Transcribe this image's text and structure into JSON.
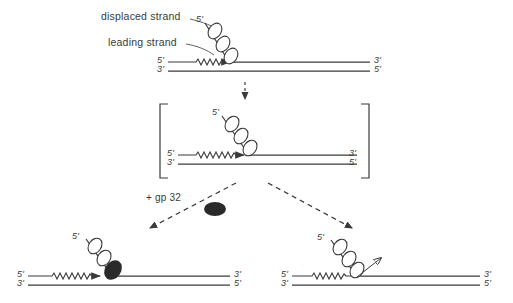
{
  "figure": {
    "ink_color": "#3a3a3a",
    "blob_color": "#2a2a2a",
    "background": "#ffffff"
  },
  "annotations": {
    "displaced_strand_label": "displaced strand",
    "leading_strand_label": "leading strand",
    "reagent_label": "+ gp 32"
  },
  "panels": {
    "top": {
      "name": "initial-fork",
      "diagonal_five_prime": "5'",
      "left_top_end": "5'",
      "left_bottom_end": "3'",
      "right_top_end": "3'",
      "right_bottom_end": "5'",
      "bead_count": 3
    },
    "intermediate": {
      "name": "bracketed-intermediate",
      "diagonal_five_prime": "5'",
      "left_top_end": "5'",
      "left_bottom_end": "3'",
      "right_top_end": "3'",
      "right_bottom_end": "5'",
      "bead_count": 3,
      "bracketed": true
    },
    "bottom_left": {
      "name": "gp32-bound-fork",
      "diagonal_five_prime": "5'",
      "left_top_end": "5'",
      "left_bottom_end": "3'",
      "right_top_end": "3'",
      "right_bottom_end": "5'",
      "bead_count": 3,
      "has_gp32_blob": true
    },
    "bottom_right": {
      "name": "strand-release-fork",
      "diagonal_five_prime": "5'",
      "left_top_end": "5'",
      "left_bottom_end": "3'",
      "right_top_end": "3'",
      "right_bottom_end": "5'",
      "bead_count": 3,
      "has_release_arrow": true
    }
  }
}
